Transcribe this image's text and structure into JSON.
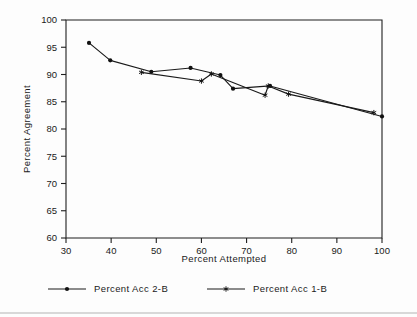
{
  "chart_data": {
    "type": "line",
    "title": "",
    "xlabel": "Percent Attempted",
    "ylabel": "Percent Agreement",
    "xlim": [
      30,
      100
    ],
    "ylim": [
      60,
      100
    ],
    "xticks": [
      30,
      40,
      50,
      60,
      70,
      80,
      90,
      100
    ],
    "yticks": [
      60,
      65,
      70,
      75,
      80,
      85,
      90,
      95,
      100
    ],
    "xtick_labels": [
      "30",
      "40",
      "50",
      "60",
      "70",
      "80",
      "90",
      "100"
    ],
    "ytick_labels": [
      "60",
      "65",
      "70",
      "75",
      "80",
      "85",
      "90",
      "95",
      "100"
    ],
    "grid": false,
    "legend_position": "bottom",
    "series": [
      {
        "name": "Percent Acc 2-B",
        "marker": "filled-circle",
        "x": [
          35.1,
          39.8,
          48.9,
          57.6,
          64.2,
          67.0,
          75.2,
          100.0
        ],
        "y": [
          95.8,
          92.6,
          90.5,
          91.2,
          89.9,
          87.4,
          87.9,
          82.3
        ]
      },
      {
        "name": "Percent Acc 1-B",
        "marker": "star",
        "x": [
          46.7,
          60.0,
          62.2,
          74.1,
          74.8,
          79.3,
          98.2
        ],
        "y": [
          90.4,
          88.8,
          90.1,
          86.2,
          87.9,
          86.4,
          83.0
        ]
      }
    ]
  },
  "legend": {
    "items": [
      {
        "label": "Percent Acc 2-B",
        "marker": "filled-circle"
      },
      {
        "label": "Percent Acc 1-B",
        "marker": "star"
      }
    ]
  }
}
